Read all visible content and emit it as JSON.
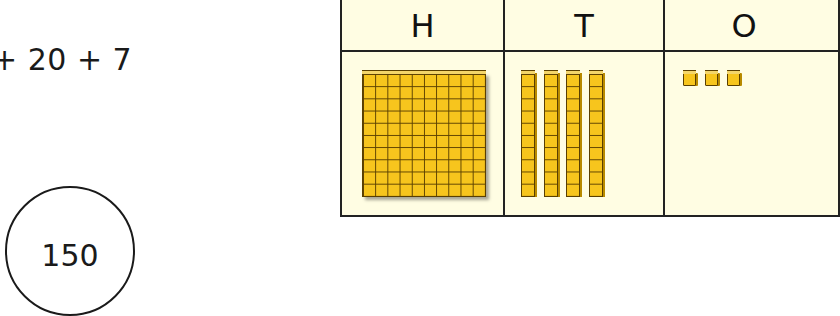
{
  "expression": {
    "text": "+ 20 + 7"
  },
  "circled_number": {
    "text": "150"
  },
  "place_value_table": {
    "headers": [
      {
        "label": "H",
        "name": "hundreds"
      },
      {
        "label": "T",
        "name": "tens"
      },
      {
        "label": "O",
        "name": "ones"
      }
    ],
    "blocks": {
      "hundreds": {
        "count": 1,
        "type": "flat-10x10"
      },
      "tens": {
        "count": 4,
        "type": "rod-10"
      },
      "ones": {
        "count": 3,
        "type": "unit-cube"
      }
    },
    "colors": {
      "background": "#fffde3",
      "block_fill": "#f7c51d",
      "block_outline": "#5a3f00",
      "border": "#222222"
    }
  }
}
